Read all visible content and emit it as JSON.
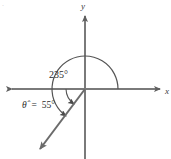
{
  "diagram": {
    "type": "angle-in-standard-position",
    "axes": {
      "x_label": "x",
      "y_label": "y",
      "origin": [
        85,
        89
      ],
      "x_axis_from": [
        6,
        89
      ],
      "x_axis_to": [
        165,
        89
      ],
      "y_axis_from": [
        85,
        12
      ],
      "y_axis_to": [
        85,
        159
      ],
      "arrowheads": [
        "x-left",
        "x-right",
        "y-top"
      ],
      "color": "#7a7a7a"
    },
    "angle": {
      "label": "235°",
      "measure": 235,
      "unit": "degrees",
      "direction": "counterclockwise",
      "arc_radius": 33,
      "arc_start_deg": 0,
      "arc_end_deg": 235,
      "label_position": [
        50,
        78
      ],
      "color": "#555555"
    },
    "reference_angle": {
      "label_symbol": "θ̂",
      "label_equals": "=",
      "label_value": "55°",
      "measure": 55,
      "unit": "degrees",
      "arc_radius": 19,
      "label_position": [
        22,
        107
      ],
      "color": "#555555"
    },
    "terminal_ray": {
      "angle_deg": 235,
      "from": [
        85,
        89
      ],
      "to": [
        38,
        152
      ],
      "arrowhead": true,
      "color": "#6b6b6b"
    },
    "corner_mark": {
      "text": "·",
      "position": [
        3,
        6
      ]
    }
  },
  "colors": {
    "background": "#ffffff",
    "axis": "#7a7a7a",
    "ray": "#6b6b6b",
    "arc": "#555555",
    "text": "#2b2b2b"
  }
}
